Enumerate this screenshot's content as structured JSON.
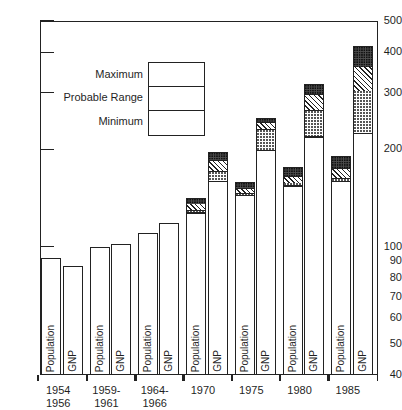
{
  "chart_data": {
    "type": "bar",
    "title": "",
    "xlabel": "",
    "ylabel": "",
    "scale": "log",
    "ylim": [
      40,
      500
    ],
    "yticks": [
      40,
      50,
      60,
      70,
      80,
      90,
      100,
      200,
      300,
      400,
      500
    ],
    "ytick_labels": [
      "40",
      "50",
      "60",
      "70",
      "80",
      "90",
      "100",
      "200",
      "300",
      "400",
      "500"
    ],
    "grid": false,
    "legend_position": "upper-left-inside",
    "legend": [
      {
        "label": "Maximum",
        "pattern": "dark-dotted"
      },
      {
        "label": "Probable Range",
        "pattern": "diagonal-hatch"
      },
      {
        "label": "Minimum",
        "pattern": "light-stipple"
      }
    ],
    "categories": [
      "1954–1956",
      "1959–1961",
      "1964–1966",
      "1970",
      "1975",
      "1980",
      "1985"
    ],
    "category_lines": [
      [
        "1954",
        "1956"
      ],
      [
        "1959-",
        "1961"
      ],
      [
        "1964-",
        "1966"
      ],
      [
        "1970",
        ""
      ],
      [
        "1975",
        ""
      ],
      [
        "1980",
        ""
      ],
      [
        "1985",
        ""
      ]
    ],
    "bar_labels": [
      "Population",
      "GNP"
    ],
    "series": [
      {
        "name": "Population",
        "base_values": [
          92,
          100,
          110,
          128,
          145,
          155,
          160
        ],
        "minimum_top": [
          92,
          100,
          110,
          130,
          147,
          158,
          163
        ],
        "probable_top": [
          92,
          100,
          110,
          136,
          152,
          166,
          175
        ],
        "maximum_top": [
          92,
          100,
          110,
          141,
          158,
          176,
          191
        ]
      },
      {
        "name": "GNP",
        "base_values": [
          87,
          102,
          118,
          160,
          200,
          220,
          226
        ],
        "minimum_top": [
          87,
          102,
          118,
          172,
          232,
          265,
          305
        ],
        "probable_top": [
          87,
          102,
          118,
          186,
          243,
          297,
          362
        ],
        "maximum_top": [
          87,
          102,
          118,
          196,
          251,
          320,
          418
        ]
      }
    ]
  }
}
